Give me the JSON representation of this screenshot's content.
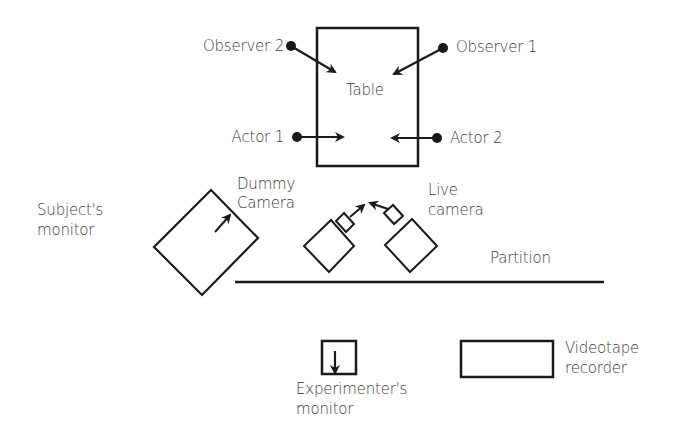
{
  "diagram": {
    "type": "experimental room layout",
    "stroke_color": "#1a1a1a",
    "text_color": "#3a3a3a",
    "table": {
      "label": "Table"
    },
    "people": [
      {
        "id": "observer2",
        "label": "Observer 2"
      },
      {
        "id": "observer1",
        "label": "Observer 1"
      },
      {
        "id": "actor1",
        "label": "Actor 1"
      },
      {
        "id": "actor2",
        "label": "Actor 2"
      }
    ],
    "subjects_monitor": {
      "line1": "Subject's",
      "line2": "monitor"
    },
    "dummy_camera": {
      "line1": "Dummy",
      "line2": "Camera"
    },
    "live_camera": {
      "line1": "Live",
      "line2": "camera"
    },
    "partition": {
      "label": "Partition"
    },
    "experimenters_monitor": {
      "line1": "Experimenter's",
      "line2": "monitor"
    },
    "videotape_recorder": {
      "line1": "Videotape",
      "line2": "recorder"
    }
  }
}
